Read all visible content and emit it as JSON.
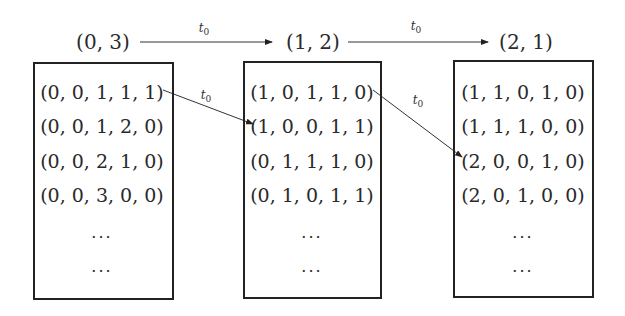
{
  "diagram": {
    "states": [
      {
        "label": "(0, 3)",
        "label_pos": [
          103,
          42
        ],
        "box": {
          "x": 33,
          "y": 62,
          "w": 141,
          "h": 238
        },
        "tuples": [
          "(0, 0, 1, 1, 1)",
          "(0, 0, 1, 2, 0)",
          "(0, 0, 2, 1, 0)",
          "(0, 0, 3, 0, 0)"
        ],
        "ellipsis": [
          "···",
          "···"
        ],
        "center_x": 102
      },
      {
        "label": "(1, 2)",
        "label_pos": [
          313,
          42
        ],
        "box": {
          "x": 243,
          "y": 61,
          "w": 139,
          "h": 238
        },
        "tuples": [
          "(1, 0, 1, 1, 0)",
          "(1, 0, 0, 1, 1)",
          "(0, 1, 1, 1, 0)",
          "(0, 1, 0, 1, 1)"
        ],
        "ellipsis": [
          "···",
          "···"
        ],
        "center_x": 312
      },
      {
        "label": "(2, 1)",
        "label_pos": [
          526,
          42
        ],
        "box": {
          "x": 453,
          "y": 60,
          "w": 141,
          "h": 238
        },
        "tuples": [
          "(1, 1, 0, 1, 0)",
          "(1, 1, 1, 0, 0)",
          "(2, 0, 0, 1, 0)",
          "(2, 0, 1, 0, 0)"
        ],
        "ellipsis": [
          "···",
          "···"
        ],
        "center_x": 523
      }
    ],
    "row_y": [
      92,
      126,
      161,
      195
    ],
    "ellipsis_y": [
      237,
      271
    ],
    "edges": [
      {
        "from": "(0, 3)",
        "to": "(1, 2)",
        "label": "t",
        "sub": "0",
        "x1": 140,
        "y1": 42,
        "x2": 272,
        "y2": 42,
        "label_pos": [
          204,
          29
        ]
      },
      {
        "from": "(1, 2)",
        "to": "(2, 1)",
        "label": "t",
        "sub": "0",
        "x1": 348,
        "y1": 42,
        "x2": 488,
        "y2": 42,
        "label_pos": [
          416,
          27
        ]
      },
      {
        "from": "(0, 0, 1, 1, 1)",
        "to": "(1, 0, 0, 1, 1)",
        "label": "t",
        "sub": "0",
        "x1": 163,
        "y1": 90,
        "x2": 253,
        "y2": 124,
        "label_pos": [
          206,
          96
        ]
      },
      {
        "from": "(1, 0, 1, 1, 0)",
        "to": "(2, 0, 0, 1, 0)",
        "label": "t",
        "sub": "0",
        "x1": 373,
        "y1": 90,
        "x2": 462,
        "y2": 157,
        "label_pos": [
          418,
          101
        ]
      }
    ]
  }
}
